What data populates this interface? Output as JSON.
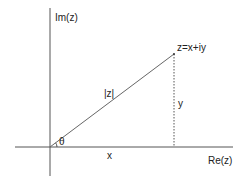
{
  "diagram": {
    "labels": {
      "imag_axis": "Im(z)",
      "real_axis": "Re(z)",
      "point": "z=x+iy",
      "modulus": "|z|",
      "imag_part": "y",
      "real_part": "x",
      "angle": "θ"
    },
    "colors": {
      "axis": "#555555",
      "vector": "#555555",
      "dotted": "#555555",
      "text": "#222222",
      "background": "#ffffff"
    },
    "elements": [
      "imaginary axis (vertical)",
      "real axis (horizontal)",
      "vector from origin to z",
      "dotted projection from z to real axis",
      "angle arc θ at origin"
    ]
  }
}
